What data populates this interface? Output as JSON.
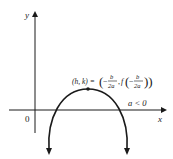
{
  "diagram": {
    "axes": {
      "x_label": "x",
      "y_label": "y",
      "origin_label": "0"
    },
    "condition_label": "a < 0",
    "vertex_label": {
      "lhs": "(h, k) =",
      "rhs": "(−b/2a, f(−b/2a))",
      "full": "(h, k) = (−b/2a, f(−b/2a))"
    },
    "colors": {
      "stroke": "#1a1a1a",
      "background": "#ffffff"
    }
  }
}
